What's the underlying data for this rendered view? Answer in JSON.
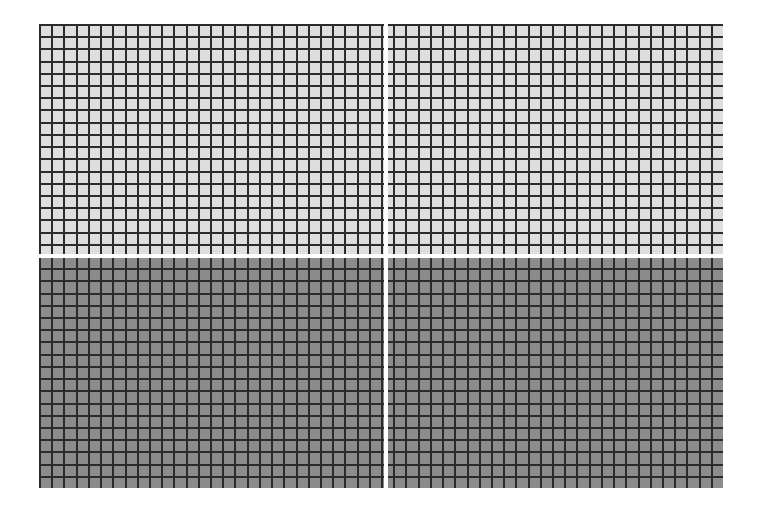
{
  "figure": {
    "columns": 56,
    "rows": 38,
    "cell_pitch_px": 12.2,
    "colors": {
      "top_fill": "#dedede",
      "bottom_fill": "#8c8c8c",
      "grid_line": "#2b2b2b",
      "divider": "#ffffff",
      "background": "#ffffff"
    }
  }
}
